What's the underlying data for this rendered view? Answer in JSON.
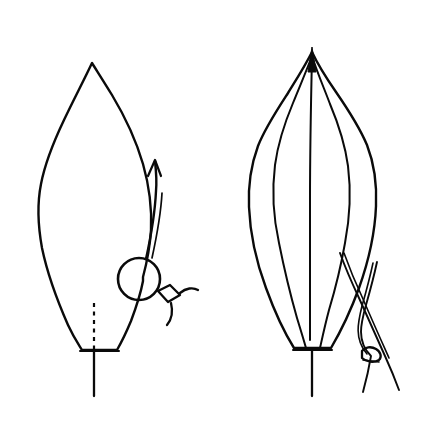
{
  "figure": {
    "background_color": "#ffffff",
    "ink_color": "#0a0a0a",
    "width": 426,
    "height": 434,
    "panel_count": 2
  },
  "panels": [
    {
      "id": "left-panel",
      "label": "Left leaf view",
      "description": "Lanceolate leaf blade in side view with attached spherical structure, connector and recurved arrow",
      "parts": [
        {
          "name": "leaf-blade",
          "label": "Leaf blade"
        },
        {
          "name": "leaf-apex",
          "label": "Apex"
        },
        {
          "name": "leaf-base",
          "label": "Base"
        },
        {
          "name": "petiole",
          "label": "Petiole"
        },
        {
          "name": "midrib-dashed",
          "label": "Midrib (hidden, dashed)"
        },
        {
          "name": "sphere",
          "label": "Spherical body"
        },
        {
          "name": "connector-node",
          "label": "Connector node"
        },
        {
          "name": "arrow",
          "label": "Direction arrow"
        }
      ]
    },
    {
      "id": "right-panel",
      "label": "Right leaf view",
      "description": "Elliptic leaf blade in face view with parallel venation and a forceps instrument crossing the margin",
      "parts": [
        {
          "name": "leaf-blade",
          "label": "Leaf blade"
        },
        {
          "name": "leaf-apex",
          "label": "Acuminate apex"
        },
        {
          "name": "leaf-base",
          "label": "Base"
        },
        {
          "name": "petiole",
          "label": "Petiole"
        },
        {
          "name": "midrib",
          "label": "Midrib"
        },
        {
          "name": "lateral-vein-left",
          "label": "Left lateral vein"
        },
        {
          "name": "lateral-vein-right",
          "label": "Right lateral vein"
        },
        {
          "name": "forceps",
          "label": "Forceps / needle instrument"
        },
        {
          "name": "forceps-clamp",
          "label": "Forceps clamp"
        }
      ]
    }
  ],
  "geometry": {
    "left": {
      "apex": {
        "x": 92,
        "y": 63
      },
      "base": {
        "x": 95,
        "y": 350
      },
      "widest_y": 190,
      "left_edge_x": 38,
      "right_edge_x": 146,
      "petiole_end_y": 396,
      "sphere_center": {
        "x": 139,
        "y": 279
      },
      "sphere_radius": 21,
      "node_center": {
        "x": 170,
        "y": 296
      },
      "arrow_tip": {
        "x": 155,
        "y": 160
      }
    },
    "right": {
      "apex": {
        "x": 312,
        "y": 47
      },
      "base": {
        "x": 312,
        "y": 350
      },
      "widest_y": 210,
      "left_edge_x": 248,
      "right_edge_x": 374,
      "petiole_end_y": 396,
      "forceps_cross": {
        "x": 355,
        "y": 300
      },
      "clamp_center": {
        "x": 372,
        "y": 356
      }
    }
  }
}
